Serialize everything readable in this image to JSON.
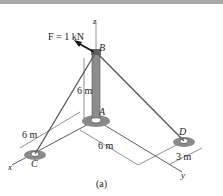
{
  "figure": {
    "caption": "(a)",
    "force_label": "F = 1 kN",
    "points": {
      "A": "A",
      "B": "B",
      "C": "C",
      "D": "D"
    },
    "axes": {
      "x": "x",
      "y": "y",
      "z": "z"
    },
    "dimensions": {
      "pole_height": "6 m",
      "ac_length": "6 m",
      "ay_length": "6 m",
      "d_offset": "3 m"
    },
    "colors": {
      "band": "#a9a9a9",
      "pole": "#8c8c8c",
      "support": "#8a8a8a",
      "line": "#333333"
    }
  }
}
